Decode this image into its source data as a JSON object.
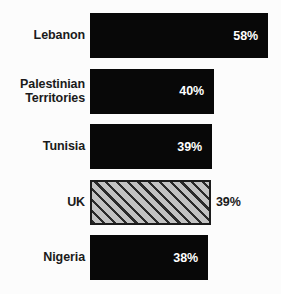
{
  "chart_data": {
    "type": "bar",
    "orientation": "horizontal",
    "title": "",
    "subtitle": "",
    "xlabel": "",
    "ylabel": "",
    "grid": false,
    "legend": null,
    "axis_visible": false,
    "value_suffix": "%",
    "categories": [
      "Lebanon",
      "Palestinian Territories",
      "Tunisia",
      "UK",
      "Nigeria"
    ],
    "values": [
      58,
      40,
      39,
      39,
      38
    ],
    "value_labels": [
      "58%",
      "40%",
      "39%",
      "39%",
      "38%"
    ],
    "highlight_index": 3,
    "bars": [
      {
        "category": "Lebanon",
        "label_lines": [
          "Lebanon"
        ],
        "value": 58,
        "value_label": "58%",
        "style": "solid",
        "label_placement": "inside",
        "fill_color": "#080808",
        "label_color": "#ffffff"
      },
      {
        "category": "Palestinian Territories",
        "label_lines": [
          "Palestinian",
          "Territories"
        ],
        "value": 40,
        "value_label": "40%",
        "style": "solid",
        "label_placement": "inside",
        "fill_color": "#080808",
        "label_color": "#ffffff"
      },
      {
        "category": "Tunisia",
        "label_lines": [
          "Tunisia"
        ],
        "value": 39,
        "value_label": "39%",
        "style": "solid",
        "label_placement": "inside",
        "fill_color": "#080808",
        "label_color": "#ffffff"
      },
      {
        "category": "UK",
        "label_lines": [
          "UK"
        ],
        "value": 39,
        "value_label": "39%",
        "style": "hatched",
        "label_placement": "outside",
        "fill_color": "#c2c2c2",
        "hatch_color": "#2a2a2a",
        "border_color": "#1c1c1c",
        "label_color": "#1a1a1a"
      },
      {
        "category": "Nigeria",
        "label_lines": [
          "Nigeria"
        ],
        "value": 38,
        "value_label": "38%",
        "style": "solid",
        "label_placement": "inside",
        "fill_color": "#080808",
        "label_color": "#ffffff"
      }
    ],
    "colors": {
      "background": "#fcfcfc",
      "bar_solid": "#080808",
      "bar_hatch_fill": "#c2c2c2",
      "bar_hatch_stripe": "#2a2a2a",
      "bar_border": "#1c1c1c",
      "category_text": "#1a1a1a",
      "value_text_inside": "#ffffff",
      "value_text_outside": "#1a1a1a"
    },
    "geometry": {
      "bar_left_px": 90,
      "bar_height_px": 45,
      "row_pitch_px": 55.5,
      "first_bar_top_px": 13,
      "bar_right_px": [
        268,
        214,
        212,
        211,
        208
      ]
    }
  }
}
